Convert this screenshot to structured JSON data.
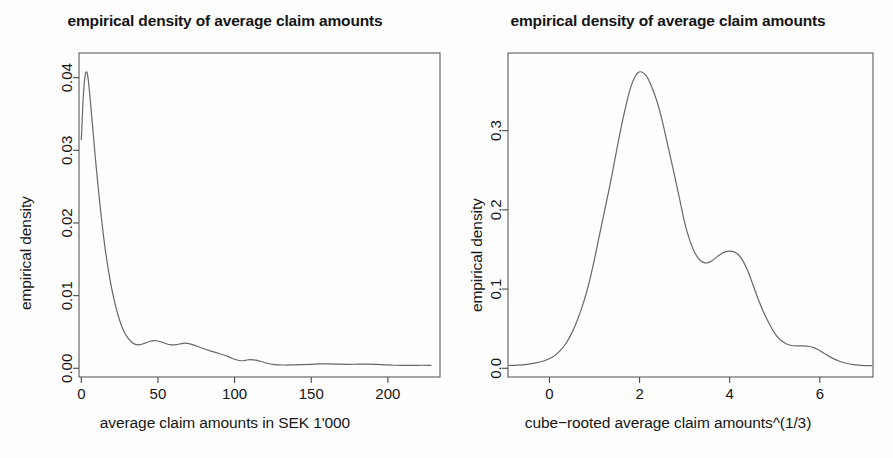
{
  "figure": {
    "width": 893,
    "height": 458,
    "background": "#ffffff",
    "line_color": "#686868",
    "axis_color": "#4a4a4a",
    "text_color": "#151515"
  },
  "chart_data": [
    {
      "type": "line",
      "panel": "left",
      "title": "empirical density of average claim amounts",
      "xlabel": "average claim amounts in SEK 1'000",
      "ylabel": "empirical density",
      "xticks": [
        0,
        50,
        100,
        150,
        200
      ],
      "xticklabels": [
        "0",
        "50",
        "100",
        "150",
        "200"
      ],
      "yticks": [
        0.0,
        0.01,
        0.02,
        0.03,
        0.04
      ],
      "yticklabels": [
        "0.00",
        "0.01",
        "0.02",
        "0.03",
        "0.04"
      ],
      "xlim": [
        -1.5,
        234
      ],
      "ylim": [
        -0.0012,
        0.0434
      ],
      "grid": false,
      "legend": "none",
      "series": [
        {
          "name": "empirical density of average claim amounts",
          "x": [
            0.0,
            0.5,
            1.0,
            1.6,
            2.2,
            2.8,
            3.4,
            4.0,
            4.6,
            5.2,
            6.0,
            7.0,
            8.0,
            9.0,
            10.0,
            11.5,
            13.0,
            14.5,
            16.0,
            18.0,
            20.0,
            22.0,
            24.0,
            26.0,
            28.0,
            30.0,
            32.0,
            34.0,
            36.0,
            38.0,
            40.0,
            42.0,
            44.0,
            46.0,
            48.0,
            50.0,
            52.0,
            54.0,
            56.0,
            58.0,
            60.0,
            62.0,
            64.0,
            66.0,
            68.0,
            70.0,
            72.0,
            74.0,
            76.0,
            78.0,
            80.0,
            84.0,
            88.0,
            92.0,
            96.0,
            100.0,
            104.0,
            107.0,
            110.0,
            114.0,
            118.0,
            122.0,
            126.0,
            132.0,
            138.0,
            144.0,
            150.0,
            156.0,
            162.0,
            168.0,
            174.0,
            180.0,
            186.0,
            192.0,
            198.0,
            204.0,
            210.0,
            216.0,
            222.0,
            228.0
          ],
          "y": [
            0.0315,
            0.0338,
            0.0362,
            0.0384,
            0.0398,
            0.0406,
            0.0408,
            0.0405,
            0.0396,
            0.0384,
            0.0366,
            0.0342,
            0.0318,
            0.0294,
            0.0271,
            0.0239,
            0.0209,
            0.0182,
            0.0158,
            0.0131,
            0.0108,
            0.0089,
            0.0073,
            0.006,
            0.005,
            0.0043,
            0.0038,
            0.0034,
            0.00325,
            0.00325,
            0.00335,
            0.0035,
            0.00365,
            0.00378,
            0.00382,
            0.00376,
            0.00363,
            0.00348,
            0.00334,
            0.00325,
            0.00322,
            0.00326,
            0.00334,
            0.00342,
            0.00345,
            0.0034,
            0.0033,
            0.00316,
            0.003,
            0.00283,
            0.00268,
            0.0024,
            0.00215,
            0.0019,
            0.0016,
            0.00124,
            0.00104,
            0.0011,
            0.0012,
            0.00112,
            0.0009,
            0.00066,
            0.00051,
            0.00045,
            0.00046,
            0.0005,
            0.00055,
            0.0006,
            0.0006,
            0.00056,
            0.00054,
            0.00056,
            0.00058,
            0.00055,
            0.00048,
            0.00042,
            0.0004,
            0.0004,
            0.00042,
            0.0004
          ]
        }
      ]
    },
    {
      "type": "line",
      "panel": "right",
      "title": "empirical density of average claim amounts",
      "xlabel": "cube−rooted average claim amounts^(1/3)",
      "ylabel": "empirical density",
      "xticks": [
        0,
        2,
        4,
        6
      ],
      "xticklabels": [
        "0",
        "2",
        "4",
        "6"
      ],
      "yticks": [
        0.0,
        0.1,
        0.2,
        0.3
      ],
      "yticklabels": [
        "0.0",
        "0.1",
        "0.2",
        "0.3"
      ],
      "xlim": [
        -0.92,
        7.18
      ],
      "ylim": [
        -0.011,
        0.398
      ],
      "grid": false,
      "legend": "none",
      "series": [
        {
          "name": "empirical density of cube-rooted average claim amounts",
          "x": [
            -0.9,
            -0.7,
            -0.5,
            -0.3,
            -0.1,
            0.05,
            0.2,
            0.35,
            0.5,
            0.62,
            0.75,
            0.88,
            1.0,
            1.12,
            1.25,
            1.38,
            1.5,
            1.62,
            1.72,
            1.8,
            1.88,
            1.96,
            2.05,
            2.15,
            2.25,
            2.38,
            2.5,
            2.62,
            2.75,
            2.88,
            3.0,
            3.1,
            3.2,
            3.3,
            3.4,
            3.5,
            3.6,
            3.7,
            3.8,
            3.9,
            4.0,
            4.1,
            4.2,
            4.3,
            4.4,
            4.5,
            4.62,
            4.75,
            4.88,
            5.0,
            5.12,
            5.25,
            5.38,
            5.5,
            5.62,
            5.75,
            5.88,
            6.0,
            6.15,
            6.3,
            6.45,
            6.6,
            6.75,
            6.9,
            7.05,
            7.16
          ],
          "y": [
            0.0035,
            0.004,
            0.005,
            0.0068,
            0.0098,
            0.0135,
            0.02,
            0.03,
            0.045,
            0.061,
            0.082,
            0.108,
            0.138,
            0.171,
            0.206,
            0.242,
            0.278,
            0.312,
            0.337,
            0.354,
            0.366,
            0.373,
            0.374,
            0.369,
            0.358,
            0.338,
            0.313,
            0.283,
            0.25,
            0.216,
            0.184,
            0.164,
            0.149,
            0.139,
            0.134,
            0.133,
            0.1355,
            0.14,
            0.144,
            0.147,
            0.148,
            0.147,
            0.143,
            0.135,
            0.123,
            0.108,
            0.089,
            0.071,
            0.056,
            0.044,
            0.036,
            0.031,
            0.0288,
            0.0282,
            0.0283,
            0.0278,
            0.0258,
            0.0222,
            0.017,
            0.0122,
            0.0085,
            0.006,
            0.0046,
            0.0038,
            0.0034,
            0.0032
          ]
        }
      ]
    }
  ]
}
